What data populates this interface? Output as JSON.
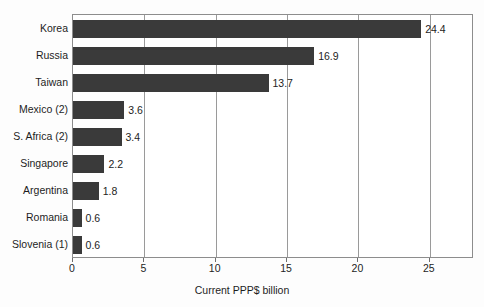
{
  "chart_data": {
    "type": "bar",
    "orientation": "horizontal",
    "title": "",
    "xlabel": "Current PPP$ billion",
    "ylabel": "",
    "categories": [
      "Korea",
      "Russia",
      "Taiwan",
      "Mexico (2)",
      "S. Africa (2)",
      "Singapore",
      "Argentina",
      "Romania",
      "Slovenia (1)"
    ],
    "values": [
      24.4,
      16.9,
      13.7,
      3.6,
      3.4,
      2.2,
      1.8,
      0.6,
      0.6
    ],
    "data_labels": [
      "24.4",
      "16.9",
      "13.7",
      "3.6",
      "3.4",
      "2.2",
      "1.8",
      "0.6",
      "0.6"
    ],
    "xlim": [
      0,
      28.1
    ],
    "xticks": [
      0,
      5,
      10,
      15,
      20,
      25
    ],
    "xtick_labels": [
      "0",
      "5",
      "10",
      "15",
      "20",
      "25"
    ],
    "grid": "vertical",
    "legend": "none",
    "bar_color": "#3a3a3a",
    "frame_color": "#8d8d8d",
    "gridline_color": "#9a9a9a",
    "background_color": "#ffffff"
  }
}
